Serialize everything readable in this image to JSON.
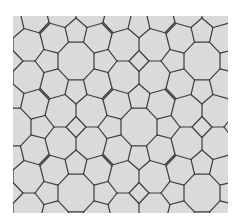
{
  "image": {
    "width": 242,
    "height": 223,
    "background": "#ffffff",
    "panel": {
      "x": 13,
      "y": 16,
      "width": 215,
      "height": 197,
      "fill": "#dadada"
    },
    "stroke": "#3c3c3c",
    "stroke_width": 1.2
  },
  "tiling": {
    "description": "Octagon-pentagon-square tiling",
    "shapes": [
      "octagon",
      "pentagon",
      "square"
    ],
    "lattice": {
      "origin_x": 76,
      "origin_y": 61,
      "dx": 63,
      "dy": 66
    },
    "octagon": {
      "apothem": 18,
      "half_edge": 7.5
    },
    "pentagon": {
      "shoulder_x": 32,
      "shoulder_y": 11,
      "tip": 41
    },
    "junction": {
      "x": 36,
      "y": 26
    },
    "square": {
      "half_diagonal": 10
    }
  }
}
